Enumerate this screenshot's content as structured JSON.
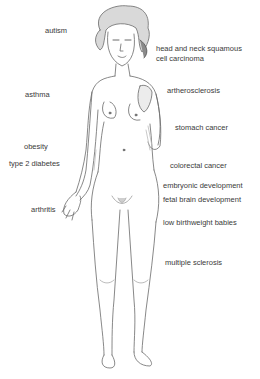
{
  "diagram": {
    "labels": {
      "autism": "autism",
      "head_neck_1": "head and neck squamous",
      "head_neck_2": "cell carcinoma",
      "asthma": "asthma",
      "artherosclerosis": "artherosclerosis",
      "stomach_cancer": "stomach cancer",
      "obesity": "obesity",
      "type2_diabetes": "type 2 diabetes",
      "colorectal_cancer": "colorectal cancer",
      "embryonic_development": "embryonic development",
      "fetal_brain_development": "fetal brain development",
      "arthritis": "arthritis",
      "low_birthweight": "low birthweight babies",
      "multiple_sclerosis": "multiple sclerosis"
    }
  }
}
